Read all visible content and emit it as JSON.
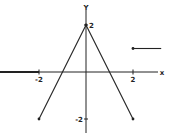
{
  "chart_data": {
    "type": "line",
    "title": "",
    "xlabel": "x",
    "ylabel": "y",
    "xlim": [
      -3.7,
      3.2
    ],
    "ylim": [
      -2.5,
      2.3
    ],
    "grid": false,
    "x_ticks": [
      {
        "value": -2,
        "label": "-2"
      },
      {
        "value": 2,
        "label": "2"
      }
    ],
    "y_ticks": [
      {
        "value": 2,
        "label": "2"
      },
      {
        "value": -2,
        "label": "-2"
      }
    ],
    "series": [
      {
        "name": "left-ray",
        "points": [
          [
            -3.7,
            0
          ],
          [
            -2,
            0
          ]
        ],
        "style": "thick",
        "open_end_dot": false
      },
      {
        "name": "left-slope",
        "points": [
          [
            -2,
            -2
          ],
          [
            0,
            2
          ]
        ],
        "end_dots": [
          [
            -2,
            -2
          ]
        ]
      },
      {
        "name": "right-slope",
        "points": [
          [
            0,
            2
          ],
          [
            2,
            -2
          ]
        ],
        "end_dots": [
          [
            0,
            2
          ],
          [
            2,
            -2
          ]
        ]
      },
      {
        "name": "right-ray",
        "points": [
          [
            2,
            1
          ],
          [
            3.2,
            1
          ]
        ],
        "end_dots": [
          [
            2,
            1
          ]
        ]
      }
    ],
    "color": "#222222"
  }
}
